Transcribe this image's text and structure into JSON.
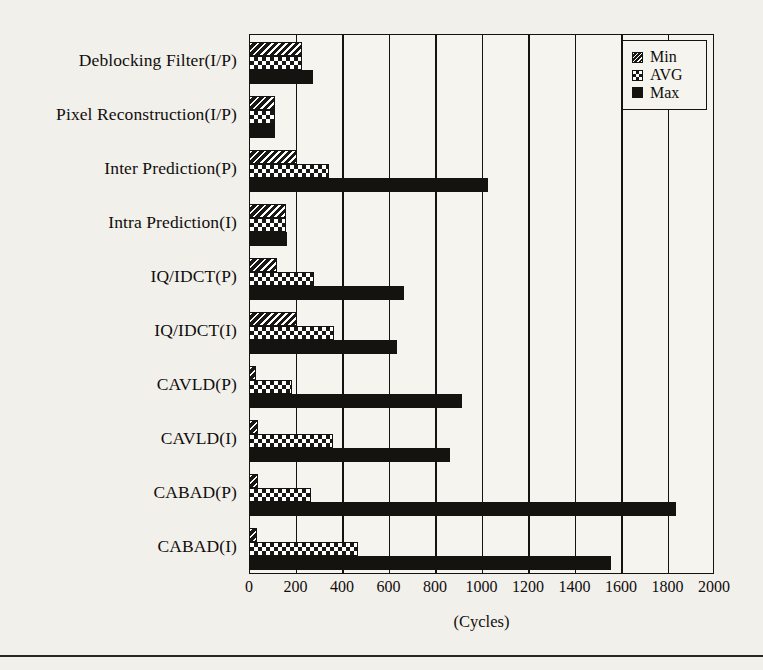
{
  "chart_data": {
    "type": "bar",
    "orientation": "horizontal",
    "title": "",
    "xlabel": "(Cycles)",
    "ylabel": "",
    "xlim": [
      0,
      2000
    ],
    "xticks": [
      0,
      200,
      400,
      600,
      800,
      1000,
      1200,
      1400,
      1600,
      1800,
      2000
    ],
    "xtick_labels": [
      "0",
      "200",
      "400",
      "600",
      "800",
      "1000",
      "1200",
      "1400",
      "1600",
      "1800",
      "2000"
    ],
    "grid": "vertical",
    "legend_position": "top-right",
    "legend": [
      "Min",
      "AVG",
      "Max"
    ],
    "categories": [
      "Deblocking Filter(I/P)",
      "Pixel Reconstruction(I/P)",
      "Inter Prediction(P)",
      "Intra Prediction(I)",
      "IQ/IDCT(P)",
      "IQ/IDCT(I)",
      "CAVLD(P)",
      "CAVLD(I)",
      "CABAD(P)",
      "CABAD(I)"
    ],
    "series": [
      {
        "name": "Min",
        "values": [
          230,
          110,
          205,
          160,
          120,
          205,
          30,
          40,
          40,
          35
        ]
      },
      {
        "name": "AVG",
        "values": [
          230,
          110,
          345,
          160,
          280,
          365,
          185,
          360,
          265,
          470
        ]
      },
      {
        "name": "Max",
        "values": [
          275,
          110,
          1030,
          165,
          665,
          635,
          915,
          865,
          1835,
          1555
        ]
      }
    ]
  },
  "legend": {
    "items": [
      {
        "label": "Min",
        "pattern": "diagonal-hatch"
      },
      {
        "label": "AVG",
        "pattern": "checker"
      },
      {
        "label": "Max",
        "pattern": "solid"
      }
    ]
  },
  "axis": {
    "x_title": "(Cycles)"
  },
  "colors": {
    "ink": "#15130f",
    "page_background": "#f2f0eb",
    "plot_background": "#f6f4ef"
  }
}
